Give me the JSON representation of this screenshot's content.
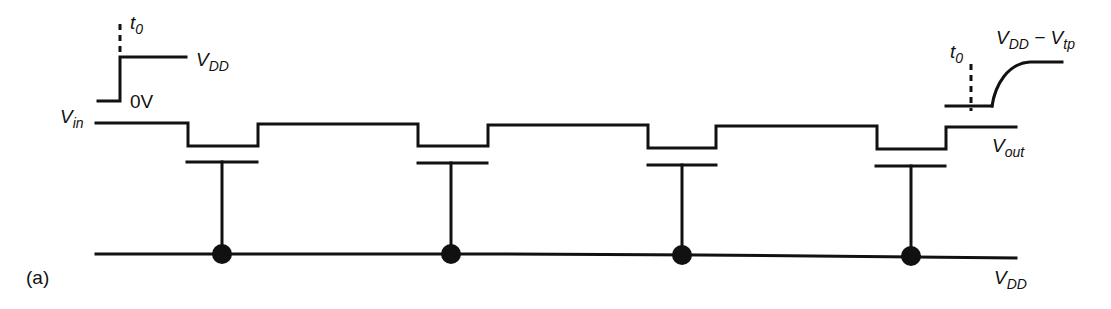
{
  "figure": {
    "panel_label": "(a)"
  },
  "input_waveform": {
    "t0_label": "t",
    "t0_sub": "0",
    "high_label": "V",
    "high_sub": "DD",
    "low_label": "0V"
  },
  "output_waveform": {
    "t0_label": "t",
    "t0_sub": "0",
    "final_label_v1": "V",
    "final_label_sub1": "DD",
    "final_label_minus": " − ",
    "final_label_v2": "V",
    "final_label_sub2": "tp"
  },
  "nodes": {
    "vin_label": "V",
    "vin_sub": "in",
    "vout_label": "V",
    "vout_sub": "out",
    "vdd_label": "V",
    "vdd_sub": "DD"
  },
  "transistors": [
    {
      "id": "M1",
      "left": 188,
      "right": 258,
      "drop_y": 146,
      "gate_y": 162,
      "stem_x": 222,
      "dot_y": 254
    },
    {
      "id": "M2",
      "left": 418,
      "right": 488,
      "drop_y": 146,
      "gate_y": 163,
      "stem_x": 451,
      "dot_y": 254
    },
    {
      "id": "M3",
      "left": 648,
      "right": 716,
      "drop_y": 148,
      "gate_y": 165,
      "stem_x": 682,
      "dot_y": 255
    },
    {
      "id": "M4",
      "left": 877,
      "right": 946,
      "drop_y": 149,
      "gate_y": 166,
      "stem_x": 911,
      "dot_y": 256
    }
  ],
  "colors": {
    "ink": "#111111",
    "background": "#ffffff"
  }
}
